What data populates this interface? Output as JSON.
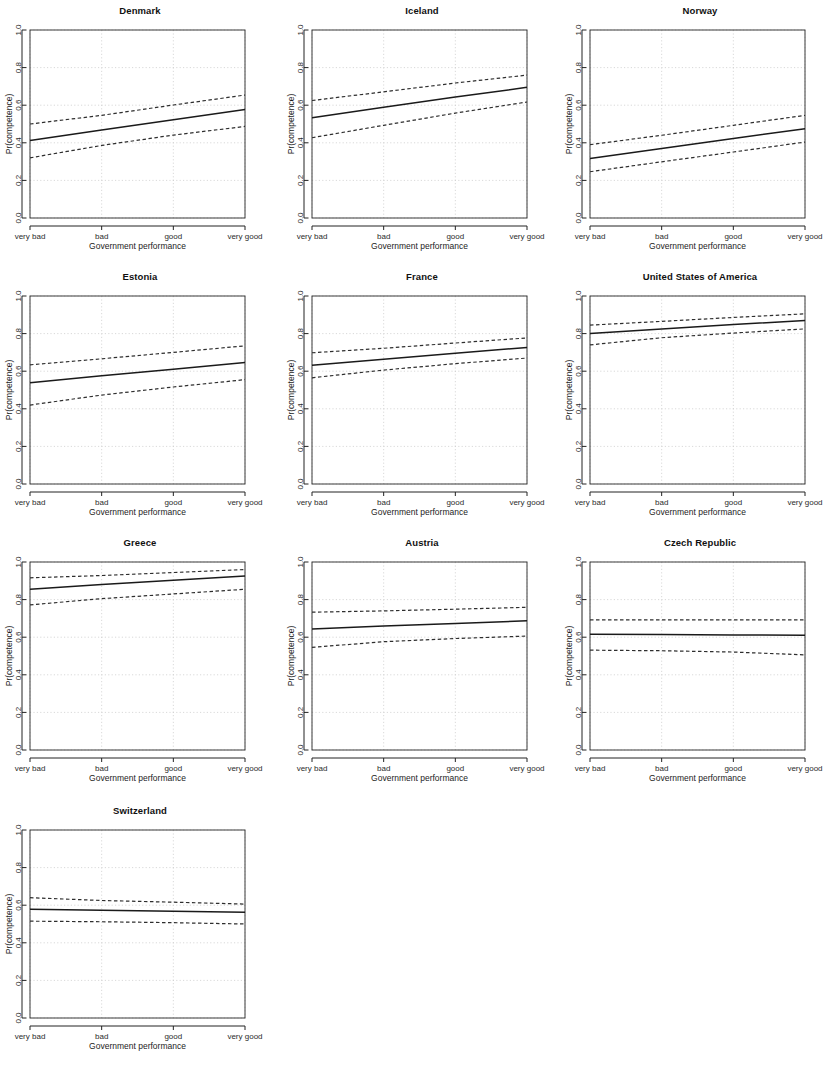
{
  "figure": {
    "type": "multi-panel-line-grid",
    "rows": 4,
    "cols": 3,
    "panel_count": 10
  },
  "axes": {
    "xlabel": "Government performance",
    "ylabel": "Pr(competence)",
    "x_tick_labels": [
      "very bad",
      "bad",
      "good",
      "very good"
    ],
    "x_tick_values": [
      1,
      2,
      3,
      4
    ],
    "y_tick_labels": [
      "0.0",
      "0.2",
      "0.4",
      "0.6",
      "0.8",
      "1.0"
    ],
    "y_tick_values": [
      0.0,
      0.2,
      0.4,
      0.6,
      0.8,
      1.0
    ],
    "ylim": [
      0.0,
      1.0
    ],
    "xlim": [
      1,
      4
    ],
    "grid": true,
    "legend": "none"
  },
  "style": {
    "fit_line_color": "#1a1a1a",
    "ci_line_color": "#2e2e2e",
    "grid_color": "#c9c9c9",
    "box_color": "#3a3a3a",
    "background": "#ffffff"
  },
  "chart_data": [
    {
      "type": "line",
      "title": "Denmark",
      "xlabel": "Government performance",
      "ylabel": "Pr(competence)",
      "x": [
        1,
        2,
        3,
        4
      ],
      "xticklabels": [
        "very bad",
        "bad",
        "good",
        "very good"
      ],
      "ylim": [
        0.0,
        1.0
      ],
      "grid": true,
      "series": [
        {
          "name": "fit",
          "style": "solid",
          "values": [
            0.412,
            0.468,
            0.523,
            0.577
          ]
        },
        {
          "name": "upper CI",
          "style": "dashed",
          "values": [
            0.5,
            0.546,
            0.601,
            0.654
          ]
        },
        {
          "name": "lower CI",
          "style": "dashed",
          "values": [
            0.32,
            0.386,
            0.441,
            0.487
          ]
        }
      ]
    },
    {
      "type": "line",
      "title": "Iceland",
      "xlabel": "Government performance",
      "ylabel": "Pr(competence)",
      "x": [
        1,
        2,
        3,
        4
      ],
      "xticklabels": [
        "very bad",
        "bad",
        "good",
        "very good"
      ],
      "ylim": [
        0.0,
        1.0
      ],
      "grid": true,
      "series": [
        {
          "name": "fit",
          "style": "solid",
          "values": [
            0.533,
            0.589,
            0.643,
            0.695
          ]
        },
        {
          "name": "upper CI",
          "style": "dashed",
          "values": [
            0.625,
            0.671,
            0.718,
            0.76
          ]
        },
        {
          "name": "lower CI",
          "style": "dashed",
          "values": [
            0.427,
            0.493,
            0.558,
            0.617
          ]
        }
      ]
    },
    {
      "type": "line",
      "title": "Norway",
      "xlabel": "Government performance",
      "ylabel": "Pr(competence)",
      "x": [
        1,
        2,
        3,
        4
      ],
      "xticklabels": [
        "very bad",
        "bad",
        "good",
        "very good"
      ],
      "ylim": [
        0.0,
        1.0
      ],
      "grid": true,
      "series": [
        {
          "name": "fit",
          "style": "solid",
          "values": [
            0.316,
            0.37,
            0.423,
            0.475
          ]
        },
        {
          "name": "upper CI",
          "style": "dashed",
          "values": [
            0.39,
            0.44,
            0.493,
            0.546
          ]
        },
        {
          "name": "lower CI",
          "style": "dashed",
          "values": [
            0.246,
            0.299,
            0.351,
            0.404
          ]
        }
      ]
    },
    {
      "type": "line",
      "title": "Estonia",
      "xlabel": "Government performance",
      "ylabel": "Pr(competence)",
      "x": [
        1,
        2,
        3,
        4
      ],
      "xticklabels": [
        "very bad",
        "bad",
        "good",
        "very good"
      ],
      "ylim": [
        0.0,
        1.0
      ],
      "grid": true,
      "series": [
        {
          "name": "fit",
          "style": "solid",
          "values": [
            0.538,
            0.576,
            0.611,
            0.646
          ]
        },
        {
          "name": "upper CI",
          "style": "dashed",
          "values": [
            0.634,
            0.666,
            0.7,
            0.735
          ]
        },
        {
          "name": "lower CI",
          "style": "dashed",
          "values": [
            0.42,
            0.473,
            0.516,
            0.555
          ]
        }
      ]
    },
    {
      "type": "line",
      "title": "France",
      "xlabel": "Government performance",
      "ylabel": "Pr(competence)",
      "x": [
        1,
        2,
        3,
        4
      ],
      "xticklabels": [
        "very bad",
        "bad",
        "good",
        "very good"
      ],
      "ylim": [
        0.0,
        1.0
      ],
      "grid": true,
      "series": [
        {
          "name": "fit",
          "style": "solid",
          "values": [
            0.631,
            0.664,
            0.696,
            0.726
          ]
        },
        {
          "name": "upper CI",
          "style": "dashed",
          "values": [
            0.698,
            0.722,
            0.75,
            0.777
          ]
        },
        {
          "name": "lower CI",
          "style": "dashed",
          "values": [
            0.565,
            0.606,
            0.64,
            0.67
          ]
        }
      ]
    },
    {
      "type": "line",
      "title": "United States of America",
      "xlabel": "Government performance",
      "ylabel": "Pr(competence)",
      "x": [
        1,
        2,
        3,
        4
      ],
      "xticklabels": [
        "very bad",
        "bad",
        "good",
        "very good"
      ],
      "ylim": [
        0.0,
        1.0
      ],
      "grid": true,
      "series": [
        {
          "name": "fit",
          "style": "solid",
          "values": [
            0.8,
            0.825,
            0.848,
            0.87
          ]
        },
        {
          "name": "upper CI",
          "style": "dashed",
          "values": [
            0.845,
            0.865,
            0.886,
            0.905
          ]
        },
        {
          "name": "lower CI",
          "style": "dashed",
          "values": [
            0.74,
            0.778,
            0.803,
            0.825
          ]
        }
      ]
    },
    {
      "type": "line",
      "title": "Greece",
      "xlabel": "Government performance",
      "ylabel": "Pr(competence)",
      "x": [
        1,
        2,
        3,
        4
      ],
      "xticklabels": [
        "very bad",
        "bad",
        "good",
        "very good"
      ],
      "ylim": [
        0.0,
        1.0
      ],
      "grid": true,
      "series": [
        {
          "name": "fit",
          "style": "solid",
          "values": [
            0.855,
            0.88,
            0.903,
            0.925
          ]
        },
        {
          "name": "upper CI",
          "style": "dashed",
          "values": [
            0.916,
            0.928,
            0.944,
            0.96
          ]
        },
        {
          "name": "lower CI",
          "style": "dashed",
          "values": [
            0.772,
            0.805,
            0.83,
            0.855
          ]
        }
      ]
    },
    {
      "type": "line",
      "title": "Austria",
      "xlabel": "Government performance",
      "ylabel": "Pr(competence)",
      "x": [
        1,
        2,
        3,
        4
      ],
      "xticklabels": [
        "very bad",
        "bad",
        "good",
        "very good"
      ],
      "ylim": [
        0.0,
        1.0
      ],
      "grid": true,
      "series": [
        {
          "name": "fit",
          "style": "solid",
          "values": [
            0.644,
            0.659,
            0.673,
            0.687
          ]
        },
        {
          "name": "upper CI",
          "style": "dashed",
          "values": [
            0.733,
            0.74,
            0.749,
            0.759
          ]
        },
        {
          "name": "lower CI",
          "style": "dashed",
          "values": [
            0.546,
            0.576,
            0.593,
            0.606
          ]
        }
      ]
    },
    {
      "type": "line",
      "title": "Czech Republic",
      "xlabel": "Government performance",
      "ylabel": "Pr(competence)",
      "x": [
        1,
        2,
        3,
        4
      ],
      "xticklabels": [
        "very bad",
        "bad",
        "good",
        "very good"
      ],
      "ylim": [
        0.0,
        1.0
      ],
      "grid": true,
      "series": [
        {
          "name": "fit",
          "style": "solid",
          "values": [
            0.616,
            0.614,
            0.612,
            0.61
          ]
        },
        {
          "name": "upper CI",
          "style": "dashed",
          "values": [
            0.692,
            0.692,
            0.692,
            0.692
          ]
        },
        {
          "name": "lower CI",
          "style": "dashed",
          "values": [
            0.531,
            0.528,
            0.521,
            0.506
          ]
        }
      ]
    },
    {
      "type": "line",
      "title": "Switzerland",
      "xlabel": "Government performance",
      "ylabel": "Pr(competence)",
      "x": [
        1,
        2,
        3,
        4
      ],
      "xticklabels": [
        "very bad",
        "bad",
        "good",
        "very good"
      ],
      "ylim": [
        0.0,
        1.0
      ],
      "grid": true,
      "series": [
        {
          "name": "fit",
          "style": "solid",
          "values": [
            0.578,
            0.573,
            0.568,
            0.562
          ]
        },
        {
          "name": "upper CI",
          "style": "dashed",
          "values": [
            0.64,
            0.625,
            0.616,
            0.606
          ]
        },
        {
          "name": "lower CI",
          "style": "dashed",
          "values": [
            0.515,
            0.512,
            0.507,
            0.5
          ]
        }
      ]
    }
  ]
}
